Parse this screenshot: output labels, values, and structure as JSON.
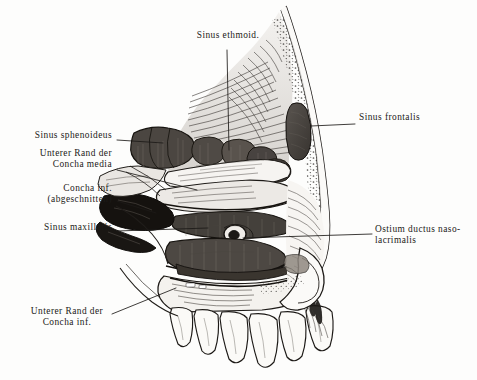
{
  "figure": {
    "background_color": "#fdfdfc",
    "ink_color": "#1c1a18",
    "style": "engraving",
    "width": 477,
    "height": 380
  },
  "labels": [
    {
      "id": "sinus-ethmoid",
      "text": "Sinus ethmoid.",
      "align": "center",
      "x": 228,
      "y": 36,
      "leader": {
        "x1": 227,
        "y1": 50,
        "x2": 229,
        "y2": 150
      }
    },
    {
      "id": "sinus-frontalis",
      "text": "Sinus frontalis",
      "align": "left",
      "x": 359,
      "y": 118,
      "leader": {
        "x1": 355,
        "y1": 124,
        "x2": 311,
        "y2": 126
      }
    },
    {
      "id": "sinus-sphenoideus",
      "text": "Sinus sphenoideus",
      "align": "right",
      "x": 112,
      "y": 135,
      "leader": {
        "x1": 117,
        "y1": 140,
        "x2": 163,
        "y2": 143
      }
    },
    {
      "id": "unterer-rand-concha-media",
      "text": "Unterer Rand der\nConcha media",
      "align": "right",
      "x": 112,
      "y": 153,
      "leader": {
        "x1": 117,
        "y1": 170,
        "x2": 197,
        "y2": 190
      }
    },
    {
      "id": "concha-inf-abgeschnitten",
      "text": "Concha inf.\n(abgeschnitten)",
      "align": "right",
      "x": 112,
      "y": 187,
      "leader": {
        "x1": 117,
        "y1": 201,
        "x2": 156,
        "y2": 213
      }
    },
    {
      "id": "sinus-maxillaris",
      "text": "Sinus maxillaris",
      "align": "right",
      "x": 112,
      "y": 226,
      "leader": {
        "x1": 117,
        "y1": 231,
        "x2": 208,
        "y2": 228
      }
    },
    {
      "id": "ostium-ductus-nasolacrimalis",
      "text": "Ostium ductus naso-\nlacrimalis",
      "align": "left",
      "x": 375,
      "y": 229,
      "leader": {
        "x1": 372,
        "y1": 234,
        "x2": 243,
        "y2": 238
      }
    },
    {
      "id": "unterer-rand-concha-inf",
      "text": "Unterer Rand der\nConcha inf.",
      "align": "center",
      "x": 67,
      "y": 310,
      "leader": {
        "x1": 112,
        "y1": 314,
        "x2": 176,
        "y2": 288
      }
    }
  ]
}
